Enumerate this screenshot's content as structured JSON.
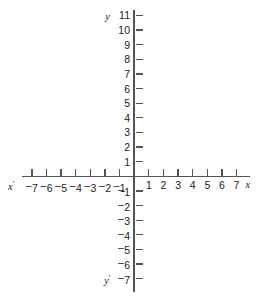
{
  "figure": {
    "kind": "cartesian-coordinate-plane",
    "background_color": "#ffffff",
    "axis_color": "#555555",
    "label_color": "#1a1a1a"
  },
  "axis_names": {
    "x_positive": "x",
    "x_negative": "x",
    "y_positive": "y",
    "y_negative": "y",
    "x_negative_prime": "′",
    "y_negative_prime": "′"
  },
  "chart_data": {
    "type": "scatter",
    "title": "",
    "subtitle": "",
    "xlabel": "x",
    "ylabel": "y",
    "grid": false,
    "legend": null,
    "xlim": [
      -7,
      7
    ],
    "ylim": [
      -7,
      11
    ],
    "x_tick_values": [
      -7,
      -6,
      -5,
      -4,
      -3,
      -2,
      -1,
      1,
      2,
      3,
      4,
      5,
      6,
      7
    ],
    "x_tick_labels": [
      "⁻7",
      "⁻6",
      "⁻5",
      "⁻4",
      "⁻3",
      "⁻2",
      "⁻1",
      "1",
      "2",
      "3",
      "4",
      "5",
      "6",
      "7"
    ],
    "y_tick_values": [
      11,
      10,
      9,
      8,
      7,
      6,
      5,
      4,
      3,
      2,
      1,
      -1,
      -2,
      -3,
      -4,
      -5,
      -6,
      -7
    ],
    "y_tick_labels": [
      "11",
      "10",
      "9",
      "8",
      "7",
      "6",
      "5",
      "4",
      "3",
      "2",
      "1",
      "⁻1",
      "⁻2",
      "⁻3",
      "⁻4",
      "⁻5",
      "⁻6",
      "⁻7"
    ],
    "series": [],
    "annotations": []
  },
  "ticks": {
    "x": [
      {
        "value": -7,
        "label": "7",
        "negative": true
      },
      {
        "value": -6,
        "label": "6",
        "negative": true
      },
      {
        "value": -5,
        "label": "5",
        "negative": true
      },
      {
        "value": -4,
        "label": "4",
        "negative": true
      },
      {
        "value": -3,
        "label": "3",
        "negative": true
      },
      {
        "value": -2,
        "label": "2",
        "negative": true
      },
      {
        "value": -1,
        "label": "1",
        "negative": true
      },
      {
        "value": 1,
        "label": "1",
        "negative": false
      },
      {
        "value": 2,
        "label": "2",
        "negative": false
      },
      {
        "value": 3,
        "label": "3",
        "negative": false
      },
      {
        "value": 4,
        "label": "4",
        "negative": false
      },
      {
        "value": 5,
        "label": "5",
        "negative": false
      },
      {
        "value": 6,
        "label": "6",
        "negative": false
      },
      {
        "value": 7,
        "label": "7",
        "negative": false
      }
    ],
    "y": [
      {
        "value": 11,
        "label": "11",
        "negative": false
      },
      {
        "value": 10,
        "label": "10",
        "negative": false
      },
      {
        "value": 9,
        "label": "9",
        "negative": false
      },
      {
        "value": 8,
        "label": "8",
        "negative": false
      },
      {
        "value": 7,
        "label": "7",
        "negative": false
      },
      {
        "value": 6,
        "label": "6",
        "negative": false
      },
      {
        "value": 5,
        "label": "5",
        "negative": false
      },
      {
        "value": 4,
        "label": "4",
        "negative": false
      },
      {
        "value": 3,
        "label": "3",
        "negative": false
      },
      {
        "value": 2,
        "label": "2",
        "negative": false
      },
      {
        "value": 1,
        "label": "1",
        "negative": false
      },
      {
        "value": -1,
        "label": "1",
        "negative": true
      },
      {
        "value": -2,
        "label": "2",
        "negative": true
      },
      {
        "value": -3,
        "label": "3",
        "negative": true
      },
      {
        "value": -4,
        "label": "4",
        "negative": true
      },
      {
        "value": -5,
        "label": "5",
        "negative": true
      },
      {
        "value": -6,
        "label": "6",
        "negative": true
      },
      {
        "value": -7,
        "label": "7",
        "negative": true
      }
    ]
  }
}
